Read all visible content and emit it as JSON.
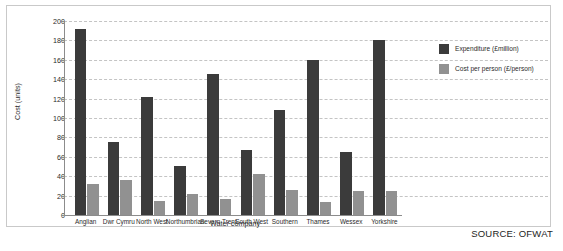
{
  "chart_data": {
    "type": "bar",
    "title": "",
    "xlabel": "Water company",
    "ylabel": "Cost (units)",
    "ylim": [
      0,
      200
    ],
    "ytick_step": 20,
    "yticks": [
      0,
      20,
      40,
      60,
      80,
      100,
      120,
      140,
      160,
      180,
      200
    ],
    "grid": true,
    "legend_position": "right",
    "categories": [
      "Anglian",
      "Dwr Cymru",
      "North West",
      "Northumbrian",
      "Severn Trent",
      "South West",
      "Southern",
      "Thames",
      "Wessex",
      "Yorkshire"
    ],
    "series": [
      {
        "name": "Expenditure  (£million)",
        "color": "#3b3b3b",
        "values": [
          192,
          75,
          122,
          51,
          145,
          67,
          108,
          160,
          65,
          180
        ]
      },
      {
        "name": "Cost per person (£/person)",
        "color": "#919191",
        "values": [
          32,
          36,
          14,
          22,
          17,
          42,
          26,
          13,
          25,
          25
        ]
      }
    ]
  },
  "source_note": "SOURCE: OFWAT",
  "colors": {
    "expenditure": "#3b3b3b",
    "cost_per_person": "#919191",
    "axis": "#8c8c8c",
    "gridline": "#c4c4c4",
    "panel_border": "#c9c9c9",
    "text": "#2b2b2b"
  }
}
